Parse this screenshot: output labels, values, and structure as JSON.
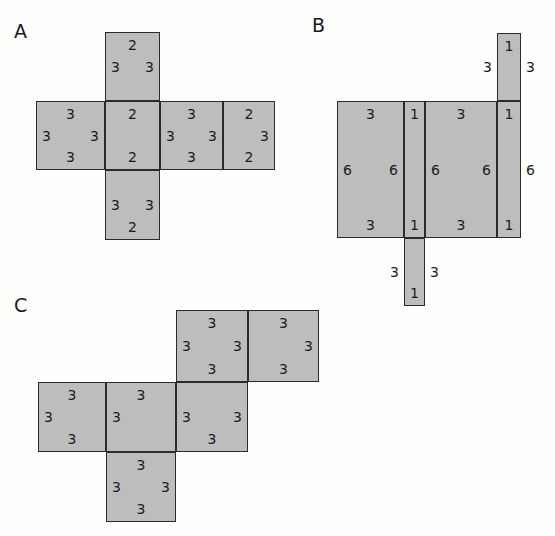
{
  "figure": {
    "title_visible": false,
    "background_color": "#fdfdfc",
    "cell_fill_color": "#bdbdbd",
    "cell_stroke_color": "#2b2b2b",
    "text_color": "#1b1b1b"
  },
  "panels": [
    {
      "id": "A",
      "label": "A",
      "description": "cross-shaped net of rectangles with edge numbers",
      "cells": [
        {
          "name": "a-top",
          "x": 105,
          "y": 32,
          "w": 55,
          "h": 69,
          "numbers": [
            {
              "pos": "top",
              "value": "2"
            },
            {
              "pos": "left",
              "value": "3"
            },
            {
              "pos": "right",
              "value": "3"
            }
          ]
        },
        {
          "name": "a-mid-left",
          "x": 36,
          "y": 101,
          "w": 69,
          "h": 69,
          "numbers": [
            {
              "pos": "top",
              "value": "3"
            },
            {
              "pos": "left",
              "value": "3"
            },
            {
              "pos": "right",
              "value": "3"
            },
            {
              "pos": "bottom",
              "value": "3"
            }
          ]
        },
        {
          "name": "a-mid-center",
          "x": 105,
          "y": 101,
          "w": 55,
          "h": 69,
          "numbers": [
            {
              "pos": "top",
              "value": "2"
            },
            {
              "pos": "bottom",
              "value": "2"
            }
          ]
        },
        {
          "name": "a-mid-right",
          "x": 160,
          "y": 101,
          "w": 63,
          "h": 69,
          "numbers": [
            {
              "pos": "top",
              "value": "3"
            },
            {
              "pos": "left",
              "value": "3"
            },
            {
              "pos": "right",
              "value": "3"
            },
            {
              "pos": "bottom",
              "value": "3"
            }
          ]
        },
        {
          "name": "a-mid-far-right",
          "x": 223,
          "y": 101,
          "w": 52,
          "h": 69,
          "numbers": [
            {
              "pos": "top",
              "value": "2"
            },
            {
              "pos": "right",
              "value": "3"
            },
            {
              "pos": "bottom",
              "value": "2"
            }
          ]
        },
        {
          "name": "a-bottom",
          "x": 105,
          "y": 170,
          "w": 55,
          "h": 70,
          "numbers": [
            {
              "pos": "left",
              "value": "3"
            },
            {
              "pos": "right",
              "value": "3"
            },
            {
              "pos": "bottom",
              "value": "2"
            }
          ]
        }
      ]
    },
    {
      "id": "B",
      "label": "B",
      "description": "net of tall rectangles with numbers 1, 3 and 6",
      "cells": [
        {
          "name": "b-top-narrow",
          "x": 497,
          "y": 33,
          "w": 24,
          "h": 68,
          "numbers": [
            {
              "pos": "top",
              "value": "1"
            },
            {
              "pos": "outleft",
              "value": "3"
            },
            {
              "pos": "outright",
              "value": "3"
            }
          ]
        },
        {
          "name": "b-left-wide",
          "x": 337,
          "y": 101,
          "w": 67,
          "h": 137,
          "numbers": [
            {
              "pos": "top",
              "value": "3"
            },
            {
              "pos": "left",
              "value": "6"
            },
            {
              "pos": "right",
              "value": "6"
            },
            {
              "pos": "bottom",
              "value": "3"
            }
          ]
        },
        {
          "name": "b-mid-narrow",
          "x": 404,
          "y": 101,
          "w": 21,
          "h": 137,
          "numbers": [
            {
              "pos": "top",
              "value": "1"
            },
            {
              "pos": "bottom",
              "value": "1"
            }
          ]
        },
        {
          "name": "b-right-wide",
          "x": 425,
          "y": 101,
          "w": 72,
          "h": 137,
          "numbers": [
            {
              "pos": "top",
              "value": "3"
            },
            {
              "pos": "left",
              "value": "6"
            },
            {
              "pos": "right",
              "value": "6"
            },
            {
              "pos": "bottom",
              "value": "3"
            }
          ]
        },
        {
          "name": "b-far-right-narrow",
          "x": 497,
          "y": 101,
          "w": 24,
          "h": 137,
          "numbers": [
            {
              "pos": "top",
              "value": "1"
            },
            {
              "pos": "outright",
              "value": "6"
            },
            {
              "pos": "bottom",
              "value": "1"
            }
          ]
        },
        {
          "name": "b-bottom-narrow",
          "x": 404,
          "y": 238,
          "w": 21,
          "h": 68,
          "numbers": [
            {
              "pos": "outleft",
              "value": "3"
            },
            {
              "pos": "outright",
              "value": "3"
            },
            {
              "pos": "bottom",
              "value": "1"
            }
          ]
        }
      ]
    },
    {
      "id": "C",
      "label": "C",
      "description": "staircase net of squares all labelled 3",
      "cells": [
        {
          "name": "c-top-left",
          "x": 176,
          "y": 310,
          "w": 72,
          "h": 72,
          "numbers": [
            {
              "pos": "top",
              "value": "3"
            },
            {
              "pos": "left",
              "value": "3"
            },
            {
              "pos": "right",
              "value": "3"
            },
            {
              "pos": "bottom",
              "value": "3"
            }
          ]
        },
        {
          "name": "c-top-right",
          "x": 248,
          "y": 310,
          "w": 71,
          "h": 72,
          "numbers": [
            {
              "pos": "top",
              "value": "3"
            },
            {
              "pos": "right",
              "value": "3"
            },
            {
              "pos": "bottom",
              "value": "3"
            }
          ]
        },
        {
          "name": "c-mid-left",
          "x": 38,
          "y": 382,
          "w": 68,
          "h": 70,
          "numbers": [
            {
              "pos": "top",
              "value": "3"
            },
            {
              "pos": "left",
              "value": "3"
            },
            {
              "pos": "bottom",
              "value": "3"
            }
          ]
        },
        {
          "name": "c-mid-center",
          "x": 106,
          "y": 382,
          "w": 70,
          "h": 70,
          "numbers": [
            {
              "pos": "top",
              "value": "3"
            },
            {
              "pos": "left",
              "value": "3"
            }
          ]
        },
        {
          "name": "c-mid-right",
          "x": 176,
          "y": 382,
          "w": 72,
          "h": 70,
          "numbers": [
            {
              "pos": "left",
              "value": "3"
            },
            {
              "pos": "right",
              "value": "3"
            },
            {
              "pos": "bottom",
              "value": "3"
            }
          ]
        },
        {
          "name": "c-bottom",
          "x": 106,
          "y": 452,
          "w": 70,
          "h": 70,
          "numbers": [
            {
              "pos": "top",
              "value": "3"
            },
            {
              "pos": "left",
              "value": "3"
            },
            {
              "pos": "right",
              "value": "3"
            },
            {
              "pos": "bottom",
              "value": "3"
            }
          ]
        }
      ]
    }
  ],
  "labels": {
    "a": {
      "text": "A",
      "x": 14,
      "y": 22
    },
    "b": {
      "text": "B",
      "x": 312,
      "y": 16
    },
    "c": {
      "text": "C",
      "x": 14,
      "y": 296
    }
  }
}
